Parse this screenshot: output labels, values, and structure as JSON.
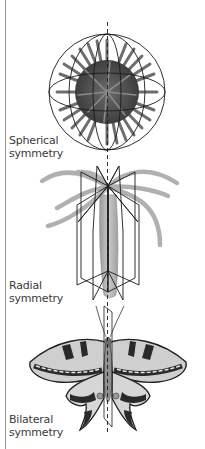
{
  "figure": {
    "type": "symmetry-types-illustration",
    "panels": [
      {
        "id": "spherical",
        "organism_icon": "sea-urchin-icon",
        "label_line1": "Spherical",
        "label_line2": "symmetry"
      },
      {
        "id": "radial",
        "organism_icon": "sea-anemone-icon",
        "label_line1": "Radial",
        "label_line2": "symmetry"
      },
      {
        "id": "bilateral",
        "organism_icon": "butterfly-icon",
        "label_line1": "Bilateral",
        "label_line2": "symmetry"
      }
    ],
    "colors": {
      "line": "#1a1a1a",
      "urchin": "#4a4a4a",
      "anemone": "#b8b8b8",
      "wing_light": "#cfcfcf",
      "wing_dark": "#2a2a2a",
      "rule": "#9a9a9a"
    }
  }
}
